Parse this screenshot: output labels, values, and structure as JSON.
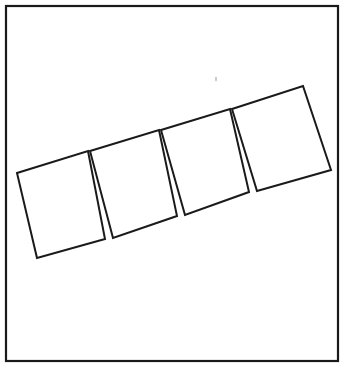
{
  "figure": {
    "background_color": "#ffffff",
    "ink_color": "#1a1a1a",
    "canvas": {
      "width": 350,
      "height": 369
    },
    "frame": {
      "name": "outer border rectangle",
      "x": 6,
      "y": 6,
      "width": 332,
      "height": 355,
      "stroke_width": 2.2,
      "stroke_color": "#1a1a1a",
      "fill": "none"
    },
    "strip": {
      "name": "tilted rectangular strip",
      "description": "A long rectangle rotated counter-clockwise about 16 degrees, divided into four quadrilateral panels separated by three thin wedge-shaped gaps that taper to a point at the top edge.",
      "rotation_degrees": -16.2,
      "panel_count": 4,
      "gap_count": 3,
      "panel_fill": "#ffffff",
      "panel_stroke": "#1a1a1a",
      "panel_stroke_width": 2.0,
      "corners": {
        "top_left": [
          17,
          173
        ],
        "top_right": [
          303,
          86
        ],
        "bottom_right": [
          331,
          170
        ],
        "bottom_left": [
          37,
          258
        ]
      },
      "panels": [
        {
          "id": "panel-1",
          "label": "leftmost panel",
          "points": "17,173 88,151 105,239 37,258"
        },
        {
          "id": "panel-2",
          "label": "second panel",
          "points": "90,151 159,130 177,216 113,238"
        },
        {
          "id": "panel-3",
          "label": "third panel",
          "points": "161,130 230,109 249,192 185,215"
        },
        {
          "id": "panel-4",
          "label": "rightmost panel",
          "points": "232,109 303,86 331,170 257,191"
        }
      ],
      "gaps": [
        {
          "id": "gap-1",
          "label": "first wedge gap",
          "apex": [
            89,
            151
          ],
          "base_left": [
            105,
            239
          ],
          "base_right": [
            113,
            238
          ]
        },
        {
          "id": "gap-2",
          "label": "second wedge gap",
          "apex": [
            160,
            130
          ],
          "base_left": [
            177,
            216
          ],
          "base_right": [
            185,
            215
          ]
        },
        {
          "id": "gap-3",
          "label": "third wedge gap",
          "apex": [
            231,
            109
          ],
          "base_left": [
            249,
            192
          ],
          "base_right": [
            257,
            191
          ]
        }
      ]
    },
    "artifact": {
      "name": "scan speck",
      "description": "faint grey speck above the strip",
      "cx": 216,
      "cy": 79,
      "rx": 1.1,
      "ry": 2.6,
      "color": "#c9c9c9"
    }
  }
}
